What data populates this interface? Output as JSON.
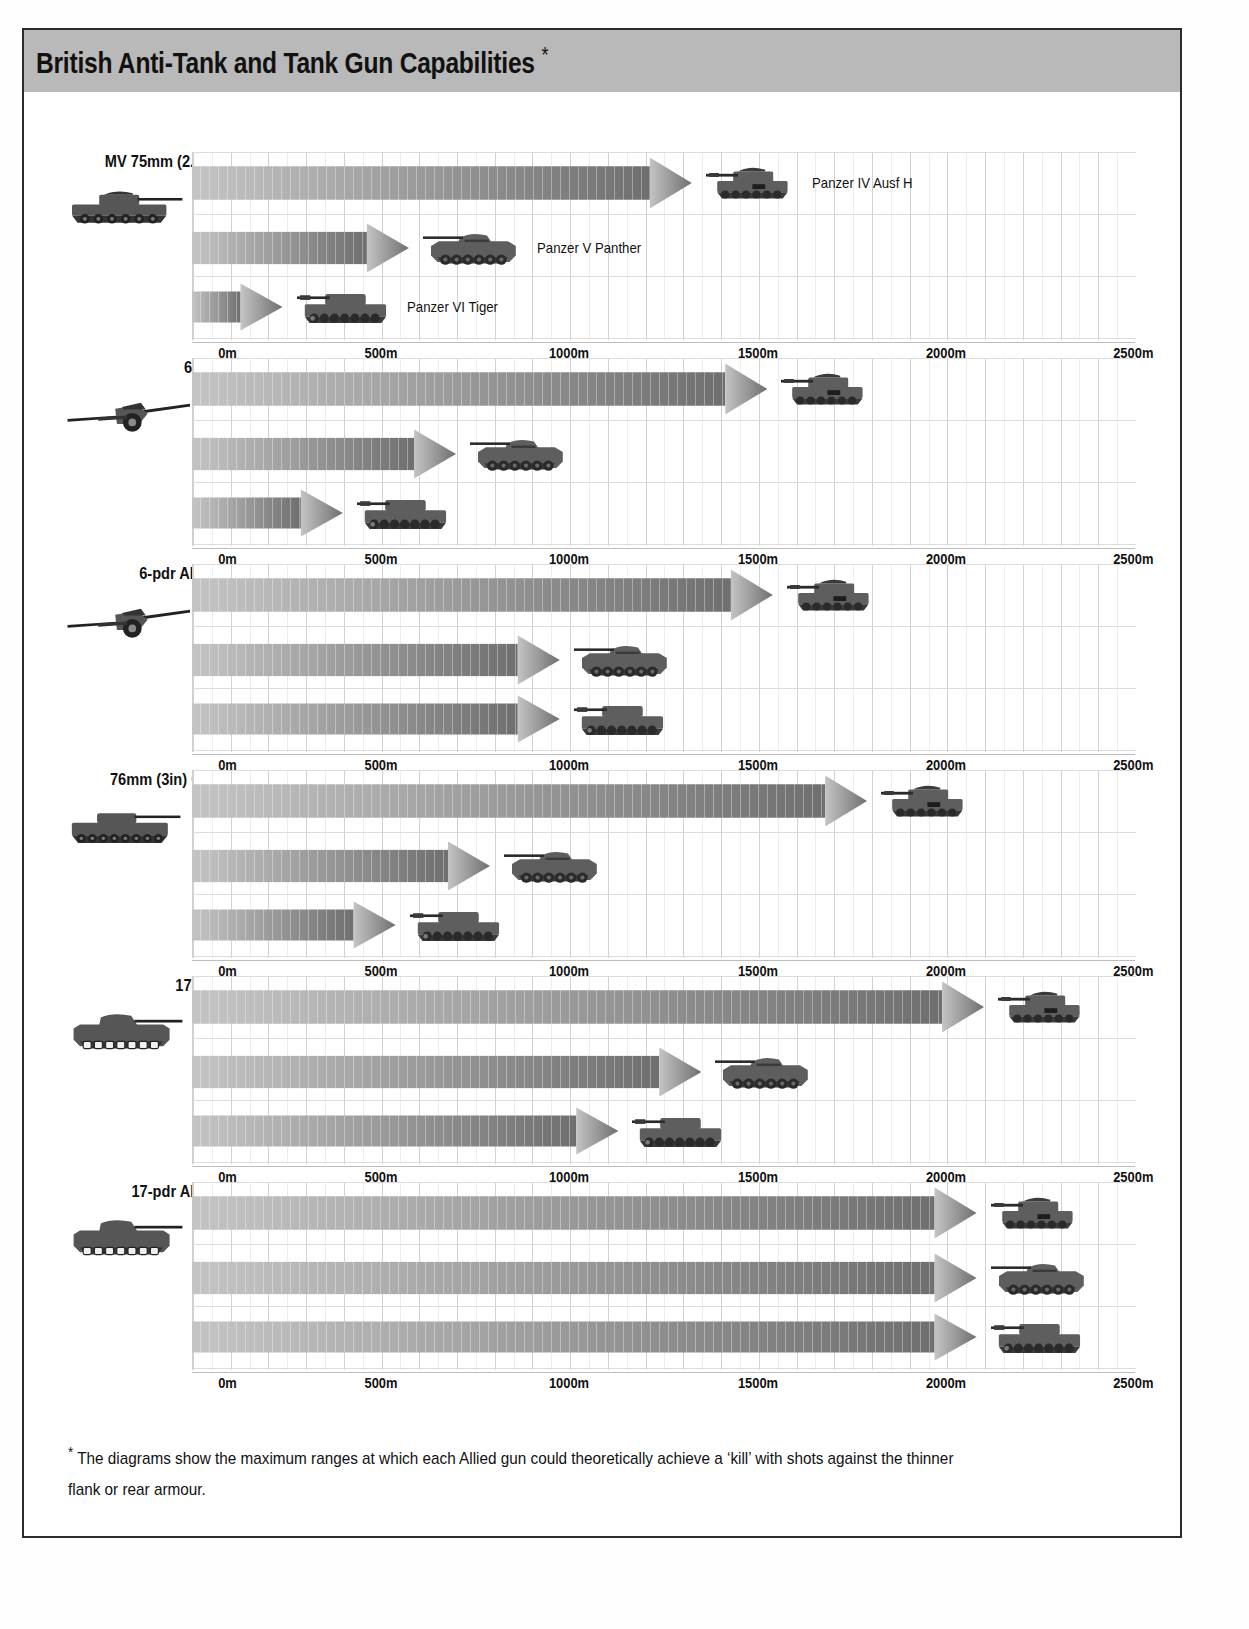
{
  "header": {
    "title": "British Anti-Tank and Tank Gun Capabilities",
    "asterisk": "*",
    "band_color": "#b9b9b9"
  },
  "footnote": {
    "marker": "*",
    "text": "The diagrams show the maximum ranges at which each Allied gun could theoretically achieve a ‘kill’ with shots against the thinner flank or rear armour."
  },
  "axis": {
    "unit": "m",
    "min": 0,
    "max": 2500,
    "ticks": [
      "0m",
      "500m",
      "1000m",
      "1500m",
      "2000m",
      "2500m"
    ],
    "tick_values": [
      0,
      500,
      1000,
      1500,
      2000,
      2500
    ],
    "minor_gridline_step": 50,
    "major_gridline_step": 100
  },
  "targets": {
    "panzer4": "Panzer IV Ausf H",
    "panzer5": "Panzer V Panther",
    "panzer6": "Panzer VI Tiger"
  },
  "legend_shown_on_section": "MV 75mm (2.9in)",
  "chart_data": {
    "type": "bar",
    "title": "British Anti-Tank and Tank Gun Capabilities",
    "subtitle": "",
    "xlabel": "Range",
    "ylabel": "",
    "xlim": [
      0,
      2500
    ],
    "grid": true,
    "legend_position": "inline-right-of-bar",
    "orientation": "horizontal",
    "units": "metres",
    "categories": [
      "Panzer IV Ausf H",
      "Panzer V Panther",
      "Panzer VI Tiger"
    ],
    "groups": [
      {
        "gun": "MV 75mm (2.9in)",
        "gun_icon": "cromwell-tank-icon",
        "values": [
          1325,
          575,
          240
        ]
      },
      {
        "gun": "6-pdr",
        "gun_icon": "antitank-gun-icon",
        "values": [
          1525,
          700,
          400
        ]
      },
      {
        "gun": "6-pdr APDS",
        "gun_icon": "antitank-gun-icon",
        "values": [
          1540,
          975,
          975
        ]
      },
      {
        "gun": "76mm (3in) Gun",
        "gun_icon": "churchill-tank-icon",
        "values": [
          1790,
          790,
          540
        ]
      },
      {
        "gun": "17-pdr",
        "gun_icon": "sherman-firefly-icon",
        "values": [
          2100,
          1350,
          1130
        ]
      },
      {
        "gun": "17-pdr APDS",
        "gun_icon": "sherman-firefly-icon",
        "values": [
          2080,
          2080,
          2080
        ]
      }
    ]
  },
  "sections": [
    {
      "label": "MV 75mm (2.9in)",
      "icon": "cromwell-tank-icon",
      "rows": [
        {
          "target": "Panzer IV Ausf H",
          "range_m": 1325,
          "show_label": true,
          "sprite": "panzer4-icon"
        },
        {
          "target": "Panzer V Panther",
          "range_m": 575,
          "show_label": true,
          "sprite": "panzer5-icon"
        },
        {
          "target": "Panzer VI Tiger",
          "range_m": 240,
          "show_label": true,
          "sprite": "panzer6-icon"
        }
      ]
    },
    {
      "label": "6-pdr",
      "icon": "antitank-gun-icon",
      "rows": [
        {
          "target": "Panzer IV Ausf H",
          "range_m": 1525,
          "show_label": false,
          "sprite": "panzer4-icon"
        },
        {
          "target": "Panzer V Panther",
          "range_m": 700,
          "show_label": false,
          "sprite": "panzer5-icon"
        },
        {
          "target": "Panzer VI Tiger",
          "range_m": 400,
          "show_label": false,
          "sprite": "panzer6-icon"
        }
      ]
    },
    {
      "label": "6-pdr APDS",
      "icon": "antitank-gun-icon",
      "rows": [
        {
          "target": "Panzer IV Ausf H",
          "range_m": 1540,
          "show_label": false,
          "sprite": "panzer4-icon"
        },
        {
          "target": "Panzer V Panther",
          "range_m": 975,
          "show_label": false,
          "sprite": "panzer5-icon"
        },
        {
          "target": "Panzer VI Tiger",
          "range_m": 975,
          "show_label": false,
          "sprite": "panzer6-icon"
        }
      ]
    },
    {
      "label": "76mm (3in) Gun",
      "icon": "churchill-tank-icon",
      "rows": [
        {
          "target": "Panzer IV Ausf H",
          "range_m": 1790,
          "show_label": false,
          "sprite": "panzer4-icon"
        },
        {
          "target": "Panzer V Panther",
          "range_m": 790,
          "show_label": false,
          "sprite": "panzer5-icon"
        },
        {
          "target": "Panzer VI Tiger",
          "range_m": 540,
          "show_label": false,
          "sprite": "panzer6-icon"
        }
      ]
    },
    {
      "label": "17-pdr",
      "icon": "sherman-firefly-icon",
      "rows": [
        {
          "target": "Panzer IV Ausf H",
          "range_m": 2100,
          "show_label": false,
          "sprite": "panzer4-icon"
        },
        {
          "target": "Panzer V Panther",
          "range_m": 1350,
          "show_label": false,
          "sprite": "panzer5-icon"
        },
        {
          "target": "Panzer VI Tiger",
          "range_m": 1130,
          "show_label": false,
          "sprite": "panzer6-icon"
        }
      ]
    },
    {
      "label": "17-pdr APDS",
      "icon": "sherman-firefly-icon",
      "rows": [
        {
          "target": "Panzer IV Ausf H",
          "range_m": 2080,
          "show_label": false,
          "sprite": "panzer4-icon"
        },
        {
          "target": "Panzer V Panther",
          "range_m": 2080,
          "show_label": false,
          "sprite": "panzer5-icon"
        },
        {
          "target": "Panzer VI Tiger",
          "range_m": 2080,
          "show_label": false,
          "sprite": "panzer6-icon"
        }
      ]
    }
  ],
  "colors": {
    "bar_light": "#c4c4c4",
    "bar_dark": "#6f6f6f",
    "grid_major": "#d2d2d2",
    "grid_minor": "#ededed",
    "text": "#111111",
    "band": "#b9b9b9",
    "frame": "#2b2b2b"
  }
}
